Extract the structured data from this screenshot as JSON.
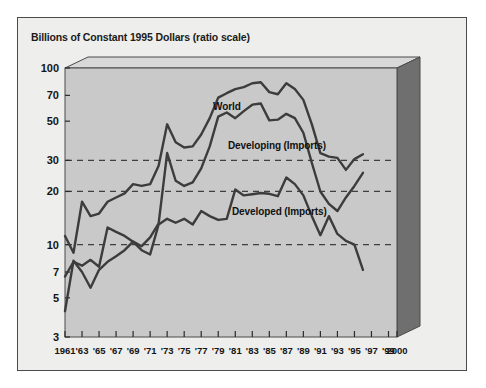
{
  "chart_data": {
    "type": "line",
    "title": "Billions of Constant 1995 Dollars (ratio scale)",
    "xlabel": "",
    "ylabel": "",
    "scale": "log",
    "ylim": [
      3,
      100
    ],
    "xlim": [
      1961,
      2000
    ],
    "grid": "dashed horizontal gridlines at 10, 20 and 30",
    "legend_position": "inline annotations on curves",
    "y_ticks": [
      100,
      70,
      50,
      30,
      20,
      10,
      7,
      5,
      3
    ],
    "gridline_values": [
      30,
      20,
      10
    ],
    "x_ticks": [
      "1961",
      "'63",
      "'65",
      "'67",
      "'69",
      "'71",
      "'73",
      "'75",
      "'77",
      "'79",
      "'81",
      "'83",
      "'85",
      "'87",
      "'89",
      "'91",
      "'93",
      "'95",
      "'97",
      "'99",
      "2000"
    ],
    "x_tick_years": [
      1961,
      1963,
      1965,
      1967,
      1969,
      1971,
      1973,
      1975,
      1977,
      1979,
      1981,
      1983,
      1985,
      1987,
      1989,
      1991,
      1993,
      1995,
      1997,
      1999,
      2000
    ],
    "x": [
      1961,
      1962,
      1963,
      1964,
      1965,
      1966,
      1967,
      1968,
      1969,
      1970,
      1971,
      1972,
      1973,
      1974,
      1975,
      1976,
      1977,
      1978,
      1979,
      1980,
      1981,
      1982,
      1983,
      1984,
      1985,
      1986,
      1987,
      1988,
      1989,
      1990,
      1991,
      1992,
      1993,
      1994,
      1995,
      1996
    ],
    "series": [
      {
        "name": "World",
        "color": "#3c3c3c",
        "values": [
          11.2,
          9.0,
          17.5,
          14.5,
          15.0,
          17.5,
          18.5,
          19.5,
          22.0,
          21.5,
          22.0,
          28.0,
          48.0,
          38.0,
          35.5,
          36.0,
          42.0,
          52.0,
          68.0,
          72.0,
          76.0,
          78.0,
          82.0,
          83.0,
          73.0,
          71.0,
          82.0,
          76.0,
          66.0,
          48.0,
          33.0,
          31.5,
          31.0,
          26.5,
          30.5,
          32.5
        ]
      },
      {
        "name": "Developing (Imports)",
        "color": "#3c3c3c",
        "values": [
          4.2,
          8.1,
          7.0,
          5.7,
          7.2,
          8.0,
          8.6,
          9.3,
          10.4,
          9.8,
          11.0,
          13.2,
          33.0,
          23.0,
          21.5,
          22.5,
          27.0,
          36.0,
          53.0,
          56.0,
          52.0,
          57.0,
          62.0,
          63.0,
          50.5,
          51.0,
          55.0,
          52.0,
          43.0,
          29.0,
          20.0,
          17.0,
          15.5,
          18.5,
          21.5,
          25.5
        ]
      },
      {
        "name": "Developed (Imports)",
        "color": "#3c3c3c",
        "values": [
          6.6,
          8.0,
          7.6,
          8.2,
          7.5,
          12.5,
          11.8,
          11.2,
          10.4,
          9.3,
          8.8,
          13.0,
          14.0,
          13.3,
          14.0,
          13.0,
          15.5,
          14.5,
          13.8,
          14.0,
          20.5,
          19.0,
          19.3,
          19.6,
          19.4,
          18.8,
          24.0,
          22.0,
          19.0,
          14.5,
          11.3,
          14.5,
          11.5,
          10.5,
          10.0,
          7.2
        ]
      }
    ],
    "annotations": [
      {
        "text": "World",
        "x_pixel": 213,
        "y_pixel": 101
      },
      {
        "text": "Developing (Imports)",
        "x_pixel": 228,
        "y_pixel": 140
      },
      {
        "text": "Developed (Imports)",
        "x_pixel": 232,
        "y_pixel": 206
      }
    ]
  },
  "frame": {
    "panel_bg": "#eeeeec",
    "plot_bg": "#c9c9c9",
    "block_top_face": "#d8d8d8",
    "block_side_face": "#6b6b6b",
    "line_color": "#3c3c3c",
    "border_color": "#4a4a4a"
  }
}
